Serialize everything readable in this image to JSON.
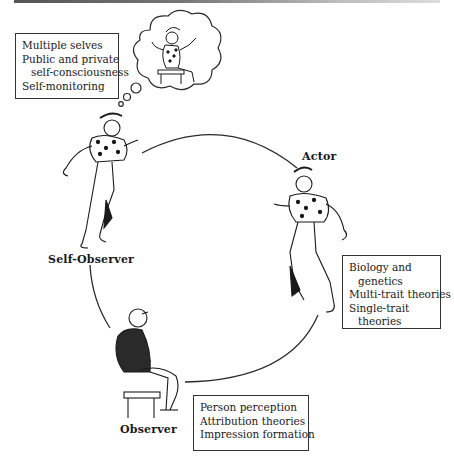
{
  "diagram": {
    "type": "cycle",
    "nodes": [
      {
        "id": "self-observer",
        "label": "Self-Observer",
        "figure": "jester-figure-dancing-with-thought-bubble",
        "topics": [
          "Multiple selves",
          "Public and private",
          "self-consciousness",
          "Self-monitoring"
        ]
      },
      {
        "id": "actor",
        "label": "Actor",
        "figure": "jester-figure-dancing",
        "topics": [
          "Biology and",
          "genetics",
          "Multi-trait theories",
          "Single-trait",
          "theories"
        ]
      },
      {
        "id": "observer",
        "label": "Observer",
        "figure": "man-seated-on-stool",
        "topics": [
          "Person perception",
          "Attribution theories",
          "Impression formation"
        ]
      }
    ],
    "thought_bubble": {
      "content": "jester-figure-seated-on-stool"
    },
    "edges": [
      {
        "from": "self-observer",
        "to": "actor"
      },
      {
        "from": "actor",
        "to": "observer"
      },
      {
        "from": "observer",
        "to": "self-observer"
      }
    ]
  },
  "colors": {
    "line": "#2a2a2a",
    "text": "#1a1a1a",
    "background": "#ffffff"
  }
}
